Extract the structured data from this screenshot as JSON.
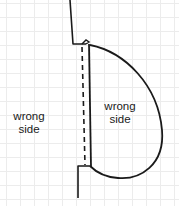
{
  "diagram": {
    "labels": {
      "outside": {
        "line1": "wrong",
        "line2": "side"
      },
      "inside": {
        "line1": "wrong",
        "line2": "side"
      }
    },
    "colors": {
      "stroke": "#1a1a1a",
      "grid": "#ececec",
      "background": "#ffffff"
    }
  }
}
